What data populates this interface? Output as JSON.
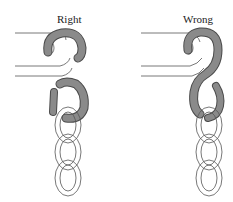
{
  "figure": {
    "panels": [
      {
        "id": "right",
        "title": "Right"
      },
      {
        "id": "wrong",
        "title": "Wrong"
      }
    ],
    "colors": {
      "shackle": "#8a8a8a",
      "shackle_outline": "#4a4a4a",
      "chain_outline": "#555555",
      "strap_outline": "#555555",
      "background": "#ffffff"
    }
  }
}
